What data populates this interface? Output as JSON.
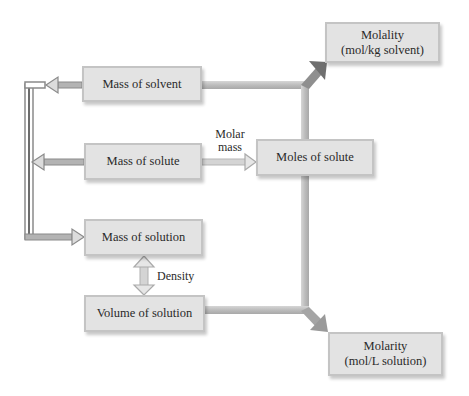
{
  "diagram": {
    "title": "",
    "nodes": {
      "mass_of_solvent": {
        "label": "Mass of solvent"
      },
      "mass_of_solute": {
        "label": "Mass of solute"
      },
      "mass_of_solution": {
        "label": "Mass of solution"
      },
      "volume_of_solution": {
        "label": "Volume of solution"
      },
      "moles_of_solute": {
        "label": "Moles of solute"
      },
      "molality": {
        "line1": "Molality",
        "line2": "(mol/kg solvent)"
      },
      "molarity": {
        "line1": "Molarity",
        "line2": "(mol/L solution)"
      }
    },
    "edge_labels": {
      "molar_mass_line1": "Molar",
      "molar_mass_line2": "mass",
      "density": "Density"
    },
    "edges": [
      {
        "from": "mass_of_solute",
        "to": "moles_of_solute",
        "label": "Molar mass"
      },
      {
        "from": "mass_of_solution",
        "to": "volume_of_solution",
        "label": "Density",
        "bidirectional": true
      },
      {
        "from": "mass_of_solvent",
        "to": "mass_of_solution",
        "label": ""
      },
      {
        "from": "mass_of_solute",
        "to": "mass_of_solution",
        "label": ""
      },
      {
        "from": "moles_of_solute",
        "to": "molality",
        "label": ""
      },
      {
        "from": "mass_of_solvent",
        "to": "molality",
        "label": ""
      },
      {
        "from": "moles_of_solute",
        "to": "molarity",
        "label": ""
      },
      {
        "from": "volume_of_solution",
        "to": "molarity",
        "label": ""
      }
    ],
    "colors": {
      "box_fill": "#e3e3e3",
      "box_border": "#c4c4c4",
      "dark_arrow": "#8a8a8a",
      "light_arrow": "#c9c9c9"
    }
  }
}
